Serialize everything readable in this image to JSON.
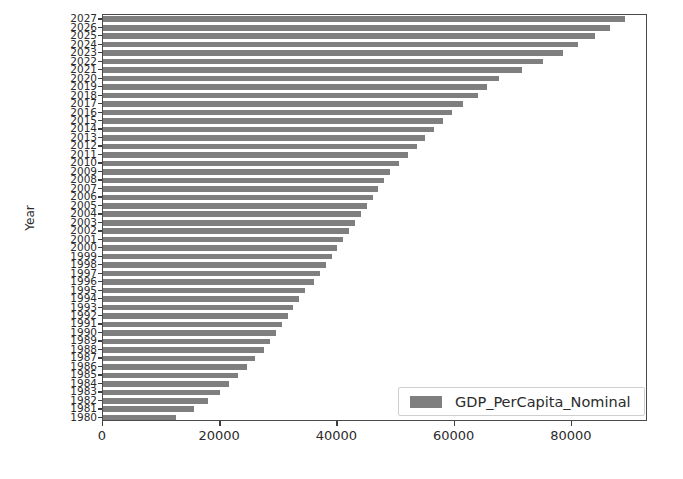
{
  "chart_data": {
    "type": "bar",
    "orientation": "horizontal",
    "title": "",
    "xlabel": "",
    "ylabel": "Year",
    "xlim": [
      0,
      93000
    ],
    "ylim": [
      1979.5,
      2027.5
    ],
    "grid": false,
    "legend": {
      "position": "lower right",
      "entries": [
        "GDP_PerCapita_Nominal"
      ]
    },
    "xticks": [
      0,
      20000,
      40000,
      60000,
      80000
    ],
    "xtick_labels": [
      "0",
      "20000",
      "40000",
      "60000",
      "80000"
    ],
    "series": [
      {
        "name": "GDP_PerCapita_Nominal",
        "color": "#7f7f7f",
        "categories": [
          "2027",
          "2026",
          "2025",
          "2024",
          "2023",
          "2022",
          "2021",
          "2020",
          "2019",
          "2018",
          "2017",
          "2016",
          "2015",
          "2014",
          "2013",
          "2012",
          "2011",
          "2010",
          "2009",
          "2008",
          "2007",
          "2006",
          "2005",
          "2004",
          "2003",
          "2002",
          "2001",
          "2000",
          "1999",
          "1998",
          "1997",
          "1996",
          "1995",
          "1994",
          "1993",
          "1992",
          "1991",
          "1990",
          "1989",
          "1988",
          "1987",
          "1986",
          "1985",
          "1984",
          "1983",
          "1982",
          "1981",
          "1980"
        ],
        "values": [
          89000,
          86500,
          84000,
          81000,
          78500,
          75000,
          71500,
          67500,
          65500,
          64000,
          61500,
          59500,
          58000,
          56500,
          55000,
          53500,
          52000,
          50500,
          49000,
          48000,
          47000,
          46000,
          45000,
          44000,
          43000,
          42000,
          41000,
          40000,
          39000,
          38000,
          37000,
          36000,
          34500,
          33500,
          32500,
          31500,
          30500,
          29500,
          28500,
          27500,
          26000,
          24500,
          23000,
          21500,
          20000,
          18000,
          15500,
          12500
        ]
      }
    ]
  },
  "axes": {
    "y_title": "Year"
  }
}
